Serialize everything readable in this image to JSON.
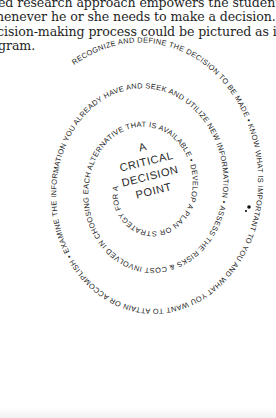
{
  "paragraph": {
    "lines": [
      "ed research approach empowers the student to f",
      "henever he or she needs to make a decision.",
      "cision-making process could be pictured as in the",
      "gram."
    ]
  },
  "diagram": {
    "type": "spiral",
    "spiral_text": {
      "outer": "RECOGNIZE AND DEFINE THE DECISION TO BE MADE • KNOW WHAT IS IMPORTANT TO YOU AND WHAT YOU WANT TO ATTAIN OR ACCOMPLISH • EXAMINE THE INFORMATION YOU ALREADY HAVE AND SEEK AND UTILIZE NEW INFORMATION • ASSESS THE RISKS & COST INVOLVED IN CHOOSING EACH ALTERNATIVE THAT IS AVAILABLE • DEVELOP A PLAN OR STRATEGY FOR ATTAINING WHAT YOU WANT"
    },
    "segments": [
      "RECOGNIZE AND DEFINE THE DECISION TO BE MADE",
      "KNOW WHAT IS IMPORTANT TO YOU AND WHAT YOU WANT TO ATTAIN OR ACCOMPLISH",
      "EXAMINE THE INFORMATION YOU ALREADY HAVE AND SEEK AND UTILIZE NEW INFORMATION",
      "ASSESS THE RISKS & COST INVOLVED IN CHOOSING EACH ALTERNATIVE THAT IS AVAILABLE",
      "DEVELOP A PLAN OR STRATEGY FOR ATTAINING WHAT YOU WANT"
    ],
    "center": {
      "lines": [
        "A",
        "CRITICAL",
        "DECISION",
        "POINT"
      ]
    },
    "text_color": "#232323"
  }
}
